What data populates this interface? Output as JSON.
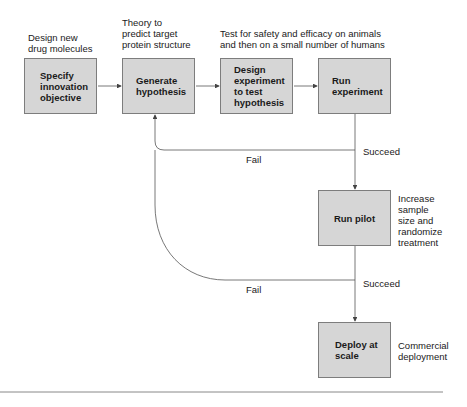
{
  "diagram": {
    "annotations": {
      "specify": "Design new\ndrug molecules",
      "generate": "Theory to\npredict target\nprotein structure",
      "design_run": "Test for safety and efficacy on animals\nand then on a small number of humans",
      "pilot": "Increase\nsample\nsize and\nrandomize\ntreatment",
      "deploy": "Commercial\ndeployment"
    },
    "nodes": [
      {
        "id": "specify",
        "label": "Specify\ninnovation\nobjective"
      },
      {
        "id": "generate",
        "label": "Generate\nhypothesis"
      },
      {
        "id": "design",
        "label": "Design\nexperiment\nto test\nhypothesis"
      },
      {
        "id": "run",
        "label": "Run\nexperiment"
      },
      {
        "id": "pilot",
        "label": "Run pilot"
      },
      {
        "id": "deploy",
        "label": "Deploy at\nscale"
      }
    ],
    "edges": {
      "fail_1": "Fail",
      "succeed_1": "Succeed",
      "fail_2": "Fail",
      "succeed_2": "Succeed"
    },
    "colors": {
      "box_fill": "#d6d6d6",
      "box_border": "#7d7d7d",
      "line": "#555555"
    }
  }
}
